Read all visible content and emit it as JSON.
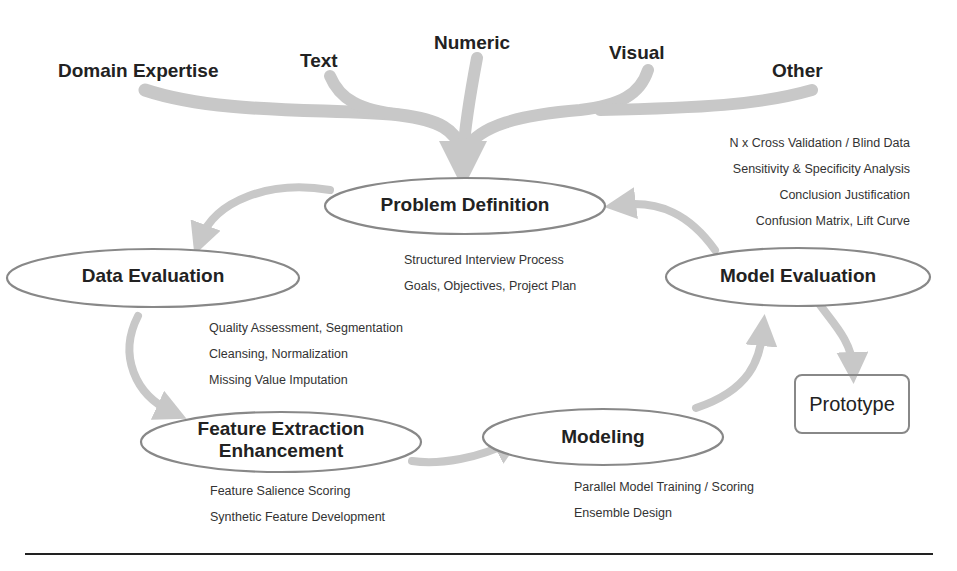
{
  "sources": [
    {
      "label": "Domain Expertise"
    },
    {
      "label": "Text"
    },
    {
      "label": "Numeric"
    },
    {
      "label": "Visual"
    },
    {
      "label": "Other"
    }
  ],
  "nodes": {
    "problem_definition": {
      "label": "Problem Definition"
    },
    "data_evaluation": {
      "label": "Data Evaluation"
    },
    "feature_extraction": {
      "line1": "Feature Extraction",
      "line2": "Enhancement"
    },
    "modeling": {
      "label": "Modeling"
    },
    "model_evaluation": {
      "label": "Model Evaluation"
    },
    "prototype": {
      "label": "Prototype"
    }
  },
  "notes": {
    "problem_definition": [
      "Structured Interview Process",
      "Goals, Objectives, Project Plan"
    ],
    "data_evaluation": [
      "Quality Assessment, Segmentation",
      "Cleansing, Normalization",
      "Missing Value Imputation"
    ],
    "feature_extraction": [
      "Feature Salience Scoring",
      "Synthetic Feature Development"
    ],
    "modeling": [
      "Parallel Model Training / Scoring",
      "Ensemble Design"
    ],
    "model_evaluation": [
      "N x Cross Validation / Blind Data",
      "Sensitivity & Specificity Analysis",
      "Conclusion Justification",
      "Confusion Matrix, Lift Curve"
    ]
  },
  "colors": {
    "arrow": "#c8c8c8",
    "ellipse_border": "#888888",
    "text": "#222222",
    "rule": "#222222"
  }
}
